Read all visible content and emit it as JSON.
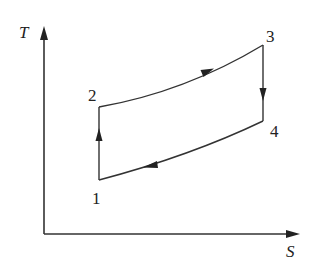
{
  "diagram": {
    "type": "T-S diagram",
    "axes": {
      "y_label": "T",
      "x_label": "S"
    },
    "states": [
      {
        "id": "1",
        "label": "1"
      },
      {
        "id": "2",
        "label": "2"
      },
      {
        "id": "3",
        "label": "3"
      },
      {
        "id": "4",
        "label": "4"
      }
    ],
    "processes": [
      {
        "from": "1",
        "to": "2",
        "shape": "vertical line",
        "direction": "up"
      },
      {
        "from": "2",
        "to": "3",
        "shape": "concave-up curve",
        "direction": "right"
      },
      {
        "from": "3",
        "to": "4",
        "shape": "vertical line",
        "direction": "down"
      },
      {
        "from": "4",
        "to": "1",
        "shape": "concave-up curve",
        "direction": "left"
      }
    ],
    "colors": {
      "line": "#333333",
      "background": "#ffffff"
    }
  }
}
